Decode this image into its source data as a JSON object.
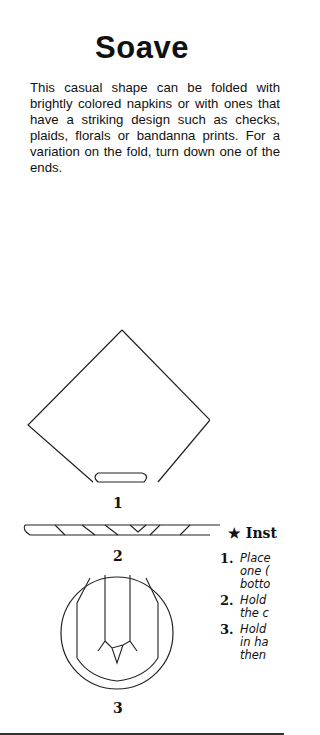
{
  "page": {
    "title": "Soave",
    "intro": "This casual shape can be folded with brightly colored napkins or with ones that have a striking design such as checks, plaids, florals or bandanna prints. For a variation on the fold, turn down one of the ends."
  },
  "figures": [
    {
      "label": "1",
      "icon": "napkin-diamond-diagram"
    },
    {
      "label": "2",
      "icon": "napkin-rolled-diagram"
    },
    {
      "label": "3",
      "icon": "napkin-on-plate-diagram"
    }
  ],
  "instructions": {
    "heading": "★ Inst",
    "steps": [
      {
        "num": "1.",
        "lines": [
          "Place",
          "one (",
          "botto"
        ]
      },
      {
        "num": "2.",
        "lines": [
          "Hold",
          "the c"
        ]
      },
      {
        "num": "3.",
        "lines": [
          "Hold",
          "in ha",
          "then"
        ]
      }
    ]
  }
}
